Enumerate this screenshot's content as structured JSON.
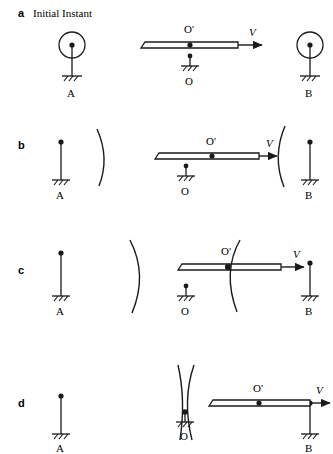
{
  "figure": {
    "title_panel": "a",
    "caption": "Initial Instant",
    "panels": [
      {
        "letter": "a",
        "caption": "Initial Instant",
        "labels": {
          "left_post": "A",
          "right_post": "B",
          "bar_top_point": "O'",
          "pivot_point": "O",
          "velocity": "V"
        }
      },
      {
        "letter": "b",
        "caption": "",
        "labels": {
          "left_post": "A",
          "right_post": "B",
          "bar_top_point": "O'",
          "pivot_point": "O",
          "velocity": "V"
        }
      },
      {
        "letter": "c",
        "caption": "",
        "labels": {
          "left_post": "A",
          "right_post": "B",
          "bar_top_point": "O'",
          "pivot_point": "O",
          "velocity": "V"
        }
      },
      {
        "letter": "d",
        "caption": "",
        "labels": {
          "left_post": "A",
          "right_post": "B",
          "bar_top_point": "O'",
          "pivot_point": "O",
          "velocity": "V"
        }
      }
    ],
    "colors": {
      "stroke": "#1a1a1a",
      "background": "#ffffff"
    }
  }
}
